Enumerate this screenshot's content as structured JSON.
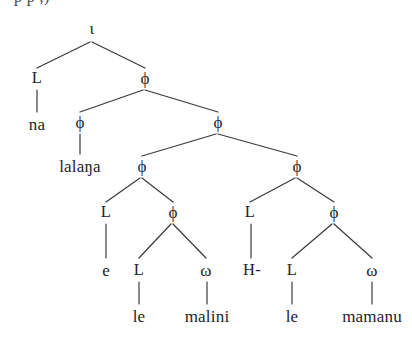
{
  "figure": {
    "name": "prosodic-structure-tree",
    "width": 412,
    "height": 347,
    "background_color": "#ffffff",
    "ink_color": "#24242a",
    "edge_color": "#3a3a42",
    "partial_caption_above": "p        p      ,)"
  },
  "nodes": [
    {
      "id": "n0",
      "label": "ι",
      "kind": "category",
      "x": 92,
      "y": 28
    },
    {
      "id": "n1",
      "label": "L",
      "kind": "tone",
      "x": 37,
      "y": 78
    },
    {
      "id": "n2",
      "label": "ϕ",
      "kind": "category",
      "x": 145,
      "y": 78
    },
    {
      "id": "n3",
      "label": "na",
      "kind": "leaf",
      "x": 37,
      "y": 124
    },
    {
      "id": "n4",
      "label": "ϕ",
      "kind": "category",
      "x": 80,
      "y": 122
    },
    {
      "id": "n5",
      "label": "ϕ",
      "kind": "category",
      "x": 218,
      "y": 122
    },
    {
      "id": "n6",
      "label": "lalaŋa",
      "kind": "leaf",
      "x": 80,
      "y": 166
    },
    {
      "id": "n7",
      "label": "ϕ",
      "kind": "category",
      "x": 142,
      "y": 166
    },
    {
      "id": "n8",
      "label": "ϕ",
      "kind": "category",
      "x": 297,
      "y": 166
    },
    {
      "id": "n9",
      "label": "L",
      "kind": "tone",
      "x": 106,
      "y": 212
    },
    {
      "id": "n10",
      "label": "ϕ",
      "kind": "category",
      "x": 173,
      "y": 212
    },
    {
      "id": "n11",
      "label": "L",
      "kind": "tone",
      "x": 250,
      "y": 212
    },
    {
      "id": "n12",
      "label": "ϕ",
      "kind": "category",
      "x": 334,
      "y": 212
    },
    {
      "id": "n13",
      "label": "e",
      "kind": "leaf",
      "x": 106,
      "y": 270
    },
    {
      "id": "n14",
      "label": "L",
      "kind": "tone",
      "x": 139,
      "y": 270
    },
    {
      "id": "n15",
      "label": "ω",
      "kind": "category",
      "x": 206,
      "y": 270
    },
    {
      "id": "n16",
      "label": "H-",
      "kind": "tone",
      "x": 252,
      "y": 270
    },
    {
      "id": "n17",
      "label": "L",
      "kind": "tone",
      "x": 292,
      "y": 270
    },
    {
      "id": "n18",
      "label": "ω",
      "kind": "category",
      "x": 372,
      "y": 270
    },
    {
      "id": "n19",
      "label": "le",
      "kind": "leaf",
      "x": 139,
      "y": 316
    },
    {
      "id": "n20",
      "label": "malini",
      "kind": "leaf",
      "x": 207,
      "y": 316
    },
    {
      "id": "n21",
      "label": "le",
      "kind": "leaf",
      "x": 292,
      "y": 316
    },
    {
      "id": "n22",
      "label": "mamanu",
      "kind": "leaf",
      "x": 372,
      "y": 316
    }
  ],
  "edges": [
    {
      "from": "n0",
      "to": "n1",
      "type": "branch",
      "x1": 90,
      "y1": 42,
      "x2": 37,
      "y2": 68
    },
    {
      "from": "n0",
      "to": "n2",
      "type": "branch",
      "x1": 92,
      "y1": 42,
      "x2": 145,
      "y2": 68
    },
    {
      "from": "n1",
      "to": "n3",
      "type": "vertical",
      "x1": 37,
      "y1": 90,
      "x2": 37,
      "y2": 112
    },
    {
      "from": "n2",
      "to": "n4",
      "type": "branch",
      "x1": 143,
      "y1": 90,
      "x2": 80,
      "y2": 112
    },
    {
      "from": "n2",
      "to": "n5",
      "type": "branch",
      "x1": 145,
      "y1": 90,
      "x2": 218,
      "y2": 112
    },
    {
      "from": "n4",
      "to": "n6",
      "type": "vertical",
      "x1": 80,
      "y1": 134,
      "x2": 80,
      "y2": 154
    },
    {
      "from": "n5",
      "to": "n7",
      "type": "branch",
      "x1": 216,
      "y1": 134,
      "x2": 142,
      "y2": 156
    },
    {
      "from": "n5",
      "to": "n8",
      "type": "branch",
      "x1": 218,
      "y1": 134,
      "x2": 297,
      "y2": 156
    },
    {
      "from": "n7",
      "to": "n9",
      "type": "branch",
      "x1": 140,
      "y1": 178,
      "x2": 106,
      "y2": 202
    },
    {
      "from": "n7",
      "to": "n10",
      "type": "branch",
      "x1": 142,
      "y1": 178,
      "x2": 173,
      "y2": 202
    },
    {
      "from": "n8",
      "to": "n11",
      "type": "branch",
      "x1": 295,
      "y1": 178,
      "x2": 250,
      "y2": 202
    },
    {
      "from": "n8",
      "to": "n12",
      "type": "branch",
      "x1": 297,
      "y1": 178,
      "x2": 334,
      "y2": 202
    },
    {
      "from": "n9",
      "to": "n13",
      "type": "vertical",
      "x1": 106,
      "y1": 224,
      "x2": 106,
      "y2": 258
    },
    {
      "from": "n10",
      "to": "n14",
      "type": "branch",
      "x1": 171,
      "y1": 224,
      "x2": 139,
      "y2": 258
    },
    {
      "from": "n10",
      "to": "n15",
      "type": "branch",
      "x1": 173,
      "y1": 224,
      "x2": 206,
      "y2": 258
    },
    {
      "from": "n11",
      "to": "n16",
      "type": "vertical",
      "x1": 251,
      "y1": 224,
      "x2": 251,
      "y2": 258
    },
    {
      "from": "n12",
      "to": "n17",
      "type": "branch",
      "x1": 332,
      "y1": 224,
      "x2": 292,
      "y2": 258
    },
    {
      "from": "n12",
      "to": "n18",
      "type": "branch",
      "x1": 334,
      "y1": 224,
      "x2": 372,
      "y2": 258
    },
    {
      "from": "n14",
      "to": "n19",
      "type": "vertical",
      "x1": 139,
      "y1": 282,
      "x2": 139,
      "y2": 304
    },
    {
      "from": "n15",
      "to": "n20",
      "type": "vertical",
      "x1": 207,
      "y1": 282,
      "x2": 207,
      "y2": 304
    },
    {
      "from": "n17",
      "to": "n21",
      "type": "vertical",
      "x1": 292,
      "y1": 282,
      "x2": 292,
      "y2": 304
    },
    {
      "from": "n18",
      "to": "n22",
      "type": "vertical",
      "x1": 372,
      "y1": 282,
      "x2": 372,
      "y2": 304
    }
  ]
}
